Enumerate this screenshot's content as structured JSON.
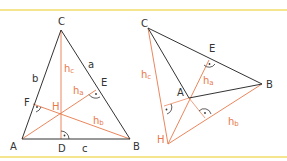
{
  "figure": {
    "frame_color": "#f2dd6a",
    "side_color": "#333333",
    "altitude_color": "#e8784a",
    "left": {
      "title": "acute triangle altitudes",
      "vertices": {
        "A": "A",
        "B": "B",
        "C": "C"
      },
      "feet": {
        "D": "D",
        "E": "E",
        "F": "F"
      },
      "sides": {
        "a": "a",
        "b": "b",
        "c": "c"
      },
      "orthocenter": "H",
      "altitudes": {
        "ha": "h",
        "hb": "h",
        "hc": "h",
        "ha_sub": "a",
        "hb_sub": "b",
        "hc_sub": "c"
      }
    },
    "right": {
      "title": "obtuse triangle altitudes",
      "vertices": {
        "A": "A",
        "B": "B",
        "C": "C"
      },
      "feet": {
        "E": "E"
      },
      "orthocenter": "H",
      "altitudes": {
        "ha": "h",
        "hb": "h",
        "hc": "h",
        "ha_sub": "a",
        "hb_sub": "b",
        "hc_sub": "c"
      }
    }
  }
}
